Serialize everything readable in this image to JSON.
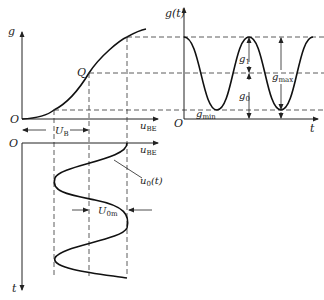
{
  "figure": {
    "transfer_curve": {
      "y_axis_label": "g",
      "x_axis_label": "u",
      "x_axis_label_sub": "BE",
      "origin_label": "O",
      "q_point_label": "Q",
      "bias_label": "U",
      "bias_label_sub": "B"
    },
    "input_signal": {
      "origin_label": "O",
      "x_axis_label": "u",
      "x_axis_label_sub": "BE",
      "t_axis_label": "t",
      "signal_label": "u",
      "signal_label_sub": "0",
      "signal_label_suffix": "(t)",
      "amplitude_label": "U",
      "amplitude_label_sub": "0m"
    },
    "output_waveform": {
      "y_axis_label": "g(t)",
      "x_axis_label": "t",
      "origin_label": "O",
      "g1_label": "g",
      "g1_sub": "1",
      "g0_label": "g",
      "g0_sub": "0",
      "gmax_label": "g",
      "gmax_sub": "max",
      "gmin_label": "g",
      "gmin_sub": "min"
    }
  }
}
